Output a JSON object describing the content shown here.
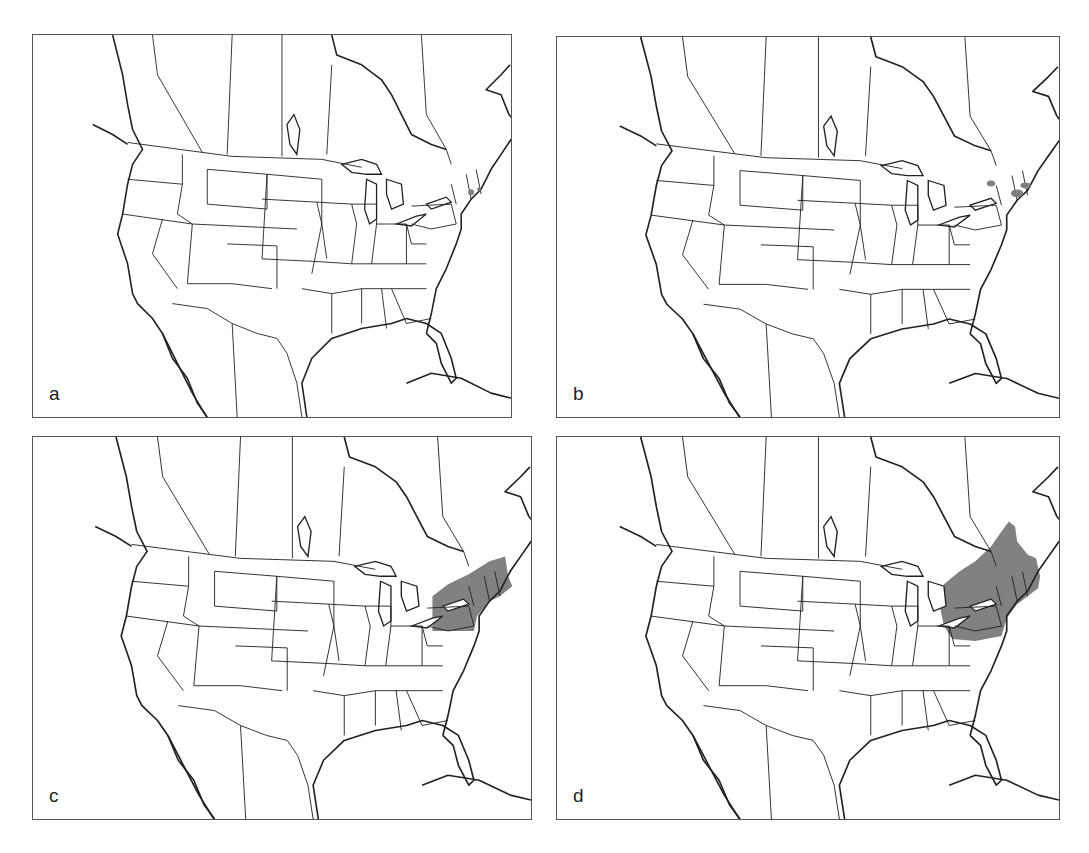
{
  "figure": {
    "region": "North America (contiguous US, southern Canada, northern Mexico, Caribbean)",
    "shade_color": "#7a7a7a",
    "panels": [
      {
        "label": "a",
        "highlight": "small scattered points on NE coast (Long Island / Connecticut area)"
      },
      {
        "label": "b",
        "highlight": "small patches in central New York and southern New England"
      },
      {
        "label": "c",
        "highlight": "shaded region: Pennsylvania, New York, New Jersey, southern New England"
      },
      {
        "label": "d",
        "highlight": "larger shaded region: Pennsylvania, New York, New England, extending into southern Ontario/Quebec along St. Lawrence"
      }
    ]
  }
}
